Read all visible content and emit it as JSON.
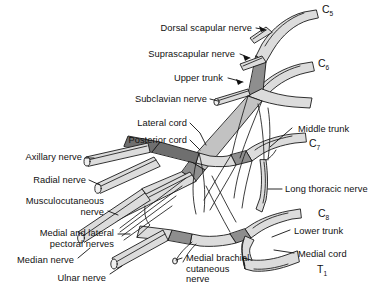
{
  "figure": {
    "type": "anatomical-diagram",
    "background": "#ffffff",
    "ink": "#111111",
    "palette": {
      "nerve_light": "#d9d9d9",
      "nerve_mid": "#bdbdbd",
      "nerve_dark": "#8c8c8c",
      "nerve_darkest": "#6b6b6b",
      "outline": "#1a1a1a",
      "highlight": "#f2f2f2"
    }
  },
  "labels": {
    "left": [
      {
        "id": "dorsal-scapular-nerve",
        "text": "Dorsal scapular nerve"
      },
      {
        "id": "suprascapular-nerve",
        "text": "Suprascapular nerve"
      },
      {
        "id": "upper-trunk",
        "text": "Upper trunk"
      },
      {
        "id": "subclavian-nerve",
        "text": "Subclavian nerve"
      },
      {
        "id": "lateral-cord",
        "text": "Lateral cord"
      },
      {
        "id": "posterior-cord",
        "text": "Posterior cord"
      },
      {
        "id": "axillary-nerve",
        "text": "Axillary nerve"
      },
      {
        "id": "radial-nerve",
        "text": "Radial nerve"
      },
      {
        "id": "musculocutaneous-nerve",
        "text": "Musculocutaneous\nnerve"
      },
      {
        "id": "medial-and-lateral-pectoral-nerves",
        "text": "Medial and lateral\npectoral nerves"
      },
      {
        "id": "median-nerve",
        "text": "Median nerve"
      },
      {
        "id": "ulnar-nerve",
        "text": "Ulnar nerve"
      }
    ],
    "right": [
      {
        "id": "middle-trunk",
        "text": "Middle trunk"
      },
      {
        "id": "long-thoracic-nerve",
        "text": "Long thoracic nerve"
      },
      {
        "id": "lower-trunk",
        "text": "Lower trunk"
      },
      {
        "id": "medial-cord",
        "text": "Medial cord"
      }
    ],
    "center": [
      {
        "id": "medial-brachial-cutaneous-nerve",
        "text": "Medial brachial\ncutaneous\nnerve"
      }
    ]
  },
  "roots": [
    {
      "id": "c5",
      "letter": "C",
      "number": "5"
    },
    {
      "id": "c6",
      "letter": "C",
      "number": "6"
    },
    {
      "id": "c7",
      "letter": "C",
      "number": "7"
    },
    {
      "id": "c8",
      "letter": "C",
      "number": "8"
    },
    {
      "id": "t1",
      "letter": "T",
      "number": "1"
    }
  ]
}
